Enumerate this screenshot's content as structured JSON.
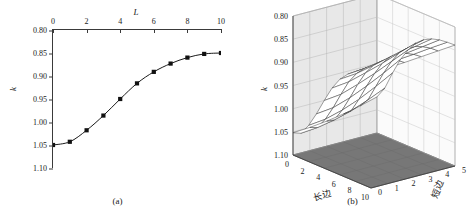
{
  "figure": {
    "panels": [
      {
        "caption": "(a)"
      },
      {
        "caption": "(b)"
      }
    ]
  },
  "chart_data": [
    {
      "type": "line",
      "title": "",
      "xlabel": "L",
      "ylabel": "k",
      "xlim": [
        0,
        10
      ],
      "ylim": [
        1.1,
        0.8
      ],
      "y_axis_inverted": true,
      "grid": false,
      "legend": "none",
      "xticks": [
        "0",
        "2",
        "4",
        "6",
        "8",
        "10"
      ],
      "xtick_values": [
        0,
        2,
        4,
        6,
        8,
        10
      ],
      "yticks": [
        "0.80",
        "0.85",
        "0.90",
        "0.95",
        "1.00",
        "1.05",
        "1.10"
      ],
      "ytick_values": [
        0.8,
        0.85,
        0.9,
        0.95,
        1.0,
        1.05,
        1.1
      ],
      "x_axis_position": "top",
      "marker": "filled-square",
      "x": [
        0,
        1,
        2,
        3,
        4,
        5,
        6,
        7,
        8,
        9,
        10
      ],
      "values": [
        1.05,
        1.043,
        1.018,
        0.986,
        0.95,
        0.916,
        0.891,
        0.873,
        0.86,
        0.852,
        0.85
      ]
    },
    {
      "type": "surface",
      "title": "",
      "xlabel": "长边",
      "ylabel": "短边",
      "zlabel": "k",
      "xlim": [
        0,
        10
      ],
      "ylim": [
        0,
        5
      ],
      "zlim": [
        1.1,
        0.8
      ],
      "z_axis_inverted": true,
      "grid": true,
      "legend": "none",
      "xticks": [
        "0",
        "2",
        "4",
        "6",
        "8",
        "10"
      ],
      "xtick_values": [
        0,
        2,
        4,
        6,
        8,
        10
      ],
      "yticks": [
        "0",
        "1",
        "2",
        "3",
        "4",
        "5"
      ],
      "ytick_values": [
        0,
        1,
        2,
        3,
        4,
        5
      ],
      "zticks": [
        "0.80",
        "0.85",
        "0.90",
        "0.95",
        "1.00",
        "1.05",
        "1.10"
      ],
      "ztick_values": [
        0.8,
        0.85,
        0.9,
        0.95,
        1.0,
        1.05,
        1.1
      ],
      "surface_style": "white-mesh",
      "floor_color": "#777777",
      "wall_color": "#e8e8e8",
      "x": [
        0,
        1,
        2,
        3,
        4,
        5,
        6,
        7,
        8,
        9,
        10
      ],
      "y": [
        0,
        1,
        2,
        3,
        4,
        5
      ],
      "z": [
        [
          1.052,
          1.046,
          1.022,
          0.99,
          0.954,
          0.92,
          0.894,
          0.876,
          0.863,
          0.855,
          0.852
        ],
        [
          1.05,
          1.043,
          1.018,
          0.986,
          0.95,
          0.916,
          0.891,
          0.873,
          0.86,
          0.852,
          0.85
        ],
        [
          1.046,
          1.036,
          1.008,
          0.974,
          0.938,
          0.906,
          0.883,
          0.867,
          0.856,
          0.85,
          0.848
        ],
        [
          1.04,
          1.026,
          0.994,
          0.958,
          0.924,
          0.895,
          0.874,
          0.861,
          0.852,
          0.847,
          0.845
        ],
        [
          1.032,
          1.012,
          0.976,
          0.94,
          0.908,
          0.882,
          0.865,
          0.854,
          0.847,
          0.843,
          0.842
        ],
        [
          1.022,
          0.996,
          0.956,
          0.92,
          0.892,
          0.87,
          0.856,
          0.847,
          0.842,
          0.84,
          0.839
        ]
      ]
    }
  ]
}
